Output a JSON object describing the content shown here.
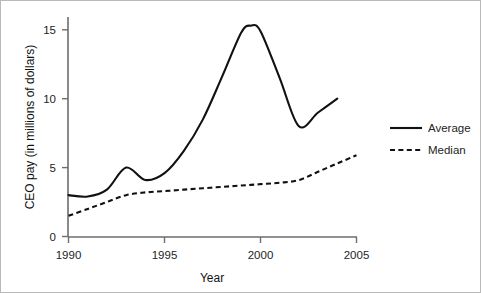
{
  "chart_data": {
    "type": "line",
    "title": "",
    "xlabel": "Year",
    "ylabel": "CEO pay (in millions of dollars)",
    "xlim": [
      1990,
      2005
    ],
    "ylim": [
      0,
      15.8
    ],
    "xticks": [
      1990,
      1995,
      2000,
      2005
    ],
    "xtick_labels": [
      "1990",
      "1995",
      "2000",
      "2005"
    ],
    "yticks": [
      0,
      5,
      10,
      15
    ],
    "ytick_labels": [
      "0",
      "5",
      "10",
      "15"
    ],
    "grid": false,
    "legend_position": "right",
    "series": [
      {
        "name": "Average",
        "style": "solid",
        "color": "#111111",
        "x": [
          1990,
          1991,
          1992,
          1993,
          1994,
          1995,
          1996,
          1997,
          1998,
          1999,
          1999.5,
          2000,
          2001,
          2002,
          2003,
          2004
        ],
        "values": [
          3.0,
          2.9,
          3.4,
          5.0,
          4.1,
          4.6,
          6.2,
          8.5,
          11.6,
          14.8,
          15.3,
          14.9,
          11.5,
          8.0,
          9.0,
          10.0
        ]
      },
      {
        "name": "Median",
        "style": "dashed",
        "color": "#111111",
        "x": [
          1990,
          1991,
          1992,
          1993,
          1994,
          1995,
          1996,
          1997,
          1998,
          1999,
          2000,
          2001,
          2002,
          2003,
          2004,
          2005
        ],
        "values": [
          1.5,
          2.0,
          2.5,
          3.0,
          3.2,
          3.3,
          3.4,
          3.5,
          3.6,
          3.7,
          3.8,
          3.9,
          4.1,
          4.7,
          5.3,
          5.9
        ]
      }
    ]
  },
  "legend": {
    "items": [
      {
        "label": "Average"
      },
      {
        "label": "Median"
      }
    ]
  },
  "axes": {
    "x_title": "Year",
    "y_title": "CEO pay (in millions of dollars)"
  }
}
